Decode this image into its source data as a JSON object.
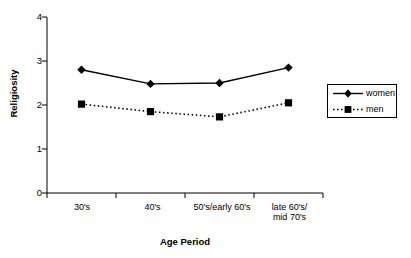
{
  "chart_data": {
    "type": "line",
    "title": "",
    "xlabel": "Age Period",
    "ylabel": "Religiosity",
    "categories": [
      "30's",
      "40's",
      "50's/early 60's",
      "late 60's/ mid 70's"
    ],
    "category_lines": [
      [
        "30's"
      ],
      [
        "40's"
      ],
      [
        "50's/early 60's"
      ],
      [
        "late 60's/",
        "mid 70's"
      ]
    ],
    "series": [
      {
        "name": "women",
        "values": [
          2.8,
          2.48,
          2.5,
          2.85
        ],
        "line_style": "solid",
        "marker": "diamond",
        "color": "#000000"
      },
      {
        "name": "men",
        "values": [
          2.02,
          1.85,
          1.73,
          2.05
        ],
        "line_style": "dotted",
        "marker": "square",
        "color": "#000000"
      }
    ],
    "ylim": [
      0,
      4
    ],
    "yticks": [
      0,
      1,
      2,
      3,
      4
    ],
    "ytick_labels": [
      "0",
      "1",
      "2",
      "3",
      "4"
    ],
    "grid": false,
    "legend_position": "right",
    "legend_entries": [
      "women",
      "men"
    ]
  },
  "axes": {
    "y_title": "Religiosity",
    "x_title": "Age Period"
  },
  "legend": {
    "entries": [
      {
        "label": "women"
      },
      {
        "label": "men"
      }
    ]
  }
}
